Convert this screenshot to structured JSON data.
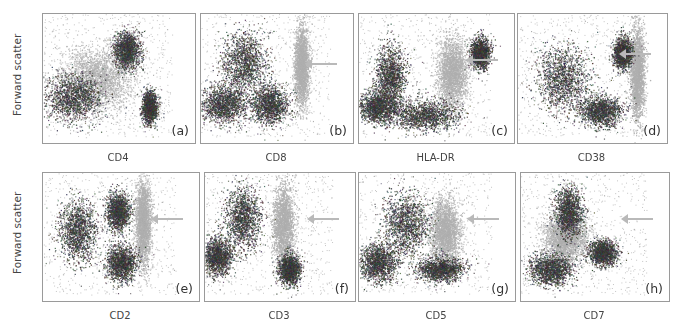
{
  "figure": {
    "y_axis_label": "Forward scatter",
    "rows": [
      {
        "panels": [
          {
            "letter": "(a)",
            "marker": "CD4",
            "arrow": false,
            "box": [
              42,
              13,
              152,
              129
            ]
          },
          {
            "letter": "(b)",
            "marker": "CD8",
            "arrow": true,
            "box": [
              200,
              13,
              152,
              129
            ]
          },
          {
            "letter": "(c)",
            "marker": "HLA-DR",
            "arrow": true,
            "box": [
              358,
              13,
              155,
              129
            ]
          },
          {
            "letter": "(d)",
            "marker": "CD38",
            "arrow": true,
            "box": [
              517,
              13,
              149,
              129
            ]
          }
        ]
      },
      {
        "panels": [
          {
            "letter": "(e)",
            "marker": "CD2",
            "arrow": true,
            "box": [
              42,
              172,
              156,
              128
            ]
          },
          {
            "letter": "(f)",
            "marker": "CD3",
            "arrow": true,
            "box": [
              204,
              172,
              150,
              128
            ]
          },
          {
            "letter": "(g)",
            "marker": "CD5",
            "arrow": true,
            "box": [
              358,
              172,
              156,
              128
            ]
          },
          {
            "letter": "(h)",
            "marker": "CD7",
            "arrow": true,
            "box": [
              520,
              172,
              148,
              128
            ]
          }
        ]
      }
    ],
    "colors": {
      "dark_population": "#2b2b2b",
      "light_population": "#b5b5b5",
      "arrow": "#b9b9b9",
      "frame": "#9a9a9a"
    }
  },
  "chart_data": [
    {
      "type": "scatter",
      "title": "(a)",
      "xlabel": "CD4",
      "ylabel": "Forward scatter",
      "clusters": [
        {
          "shade": "light",
          "center": [
            0.35,
            0.5
          ],
          "spread": [
            0.2,
            0.2
          ],
          "note": "diffuse light-grey population"
        },
        {
          "shade": "dark",
          "center": [
            0.2,
            0.65
          ],
          "spread": [
            0.15,
            0.15
          ]
        },
        {
          "shade": "dark",
          "center": [
            0.55,
            0.28
          ],
          "spread": [
            0.07,
            0.12
          ]
        },
        {
          "shade": "dark",
          "center": [
            0.7,
            0.72
          ],
          "spread": [
            0.04,
            0.1
          ],
          "note": "tight dense CD4+ cluster"
        }
      ]
    },
    {
      "type": "scatter",
      "title": "(b)",
      "xlabel": "CD8",
      "ylabel": "Forward scatter",
      "arrow_y": 0.38,
      "clusters": [
        {
          "shade": "dark",
          "center": [
            0.28,
            0.38
          ],
          "spread": [
            0.12,
            0.2
          ]
        },
        {
          "shade": "dark",
          "center": [
            0.15,
            0.7
          ],
          "spread": [
            0.12,
            0.12
          ]
        },
        {
          "shade": "dark",
          "center": [
            0.45,
            0.7
          ],
          "spread": [
            0.1,
            0.12
          ]
        },
        {
          "shade": "light",
          "center": [
            0.66,
            0.4
          ],
          "spread": [
            0.04,
            0.25
          ],
          "note": "arrowed CD8+ population"
        }
      ]
    },
    {
      "type": "scatter",
      "title": "(c)",
      "xlabel": "HLA-DR",
      "ylabel": "Forward scatter",
      "arrow_y": 0.35,
      "clusters": [
        {
          "shade": "dark",
          "center": [
            0.2,
            0.48
          ],
          "spread": [
            0.08,
            0.2
          ]
        },
        {
          "shade": "dark",
          "center": [
            0.12,
            0.72
          ],
          "spread": [
            0.1,
            0.1
          ]
        },
        {
          "shade": "dark",
          "center": [
            0.42,
            0.78
          ],
          "spread": [
            0.18,
            0.1
          ]
        },
        {
          "shade": "light",
          "center": [
            0.6,
            0.45
          ],
          "spread": [
            0.08,
            0.22
          ],
          "note": "arrowed HLA-DR+ population"
        },
        {
          "shade": "dark",
          "center": [
            0.78,
            0.3
          ],
          "spread": [
            0.05,
            0.1
          ]
        }
      ]
    },
    {
      "type": "scatter",
      "title": "(d)",
      "xlabel": "CD38",
      "ylabel": "Forward scatter",
      "arrow_y": 0.3,
      "clusters": [
        {
          "shade": "dark",
          "center": [
            0.3,
            0.5
          ],
          "spread": [
            0.15,
            0.2
          ]
        },
        {
          "shade": "dark",
          "center": [
            0.55,
            0.75
          ],
          "spread": [
            0.12,
            0.1
          ]
        },
        {
          "shade": "dark",
          "center": [
            0.7,
            0.3
          ],
          "spread": [
            0.05,
            0.1
          ]
        },
        {
          "shade": "light",
          "center": [
            0.8,
            0.45
          ],
          "spread": [
            0.04,
            0.3
          ],
          "note": "arrowed CD38+ population"
        }
      ]
    },
    {
      "type": "scatter",
      "title": "(e)",
      "xlabel": "CD2",
      "ylabel": "Forward scatter",
      "arrow_y": 0.35,
      "clusters": [
        {
          "shade": "dark",
          "center": [
            0.22,
            0.45
          ],
          "spread": [
            0.1,
            0.2
          ]
        },
        {
          "shade": "dark",
          "center": [
            0.5,
            0.7
          ],
          "spread": [
            0.08,
            0.12
          ]
        },
        {
          "shade": "dark",
          "center": [
            0.48,
            0.3
          ],
          "spread": [
            0.06,
            0.12
          ]
        },
        {
          "shade": "light",
          "center": [
            0.64,
            0.38
          ],
          "spread": [
            0.04,
            0.28
          ],
          "note": "arrowed CD2+ population"
        }
      ]
    },
    {
      "type": "scatter",
      "title": "(f)",
      "xlabel": "CD3",
      "ylabel": "Forward scatter",
      "arrow_y": 0.35,
      "clusters": [
        {
          "shade": "dark",
          "center": [
            0.25,
            0.35
          ],
          "spread": [
            0.1,
            0.2
          ]
        },
        {
          "shade": "dark",
          "center": [
            0.08,
            0.65
          ],
          "spread": [
            0.08,
            0.12
          ]
        },
        {
          "shade": "light",
          "center": [
            0.52,
            0.4
          ],
          "spread": [
            0.06,
            0.25
          ],
          "note": "arrowed CD3+ population"
        },
        {
          "shade": "dark",
          "center": [
            0.56,
            0.75
          ],
          "spread": [
            0.06,
            0.1
          ]
        }
      ]
    },
    {
      "type": "scatter",
      "title": "(g)",
      "xlabel": "CD5",
      "ylabel": "Forward scatter",
      "arrow_y": 0.35,
      "clusters": [
        {
          "shade": "dark",
          "center": [
            0.3,
            0.4
          ],
          "spread": [
            0.12,
            0.2
          ]
        },
        {
          "shade": "dark",
          "center": [
            0.12,
            0.7
          ],
          "spread": [
            0.1,
            0.12
          ]
        },
        {
          "shade": "light",
          "center": [
            0.55,
            0.45
          ],
          "spread": [
            0.08,
            0.2
          ],
          "note": "arrowed CD5+ population"
        },
        {
          "shade": "dark",
          "center": [
            0.52,
            0.75
          ],
          "spread": [
            0.12,
            0.08
          ]
        }
      ]
    },
    {
      "type": "scatter",
      "title": "(h)",
      "xlabel": "CD7",
      "ylabel": "Forward scatter",
      "arrow_y": 0.35,
      "clusters": [
        {
          "shade": "dark",
          "center": [
            0.32,
            0.3
          ],
          "spread": [
            0.08,
            0.15
          ]
        },
        {
          "shade": "light",
          "center": [
            0.3,
            0.5
          ],
          "spread": [
            0.12,
            0.15
          ],
          "note": "arrowed CD7 population"
        },
        {
          "shade": "dark",
          "center": [
            0.2,
            0.75
          ],
          "spread": [
            0.12,
            0.1
          ]
        },
        {
          "shade": "dark",
          "center": [
            0.55,
            0.62
          ],
          "spread": [
            0.08,
            0.08
          ]
        }
      ]
    }
  ]
}
